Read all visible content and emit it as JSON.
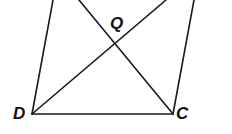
{
  "diagram": {
    "type": "geometry-quadrilateral-with-diagonals",
    "labels": {
      "D": "D",
      "C": "C",
      "Q": "Q"
    },
    "points": {
      "D": [
        32,
        114
      ],
      "C": [
        173,
        114
      ],
      "Q": [
        115,
        43
      ],
      "left_side_top": [
        53,
        0
      ],
      "right_side_top": [
        194,
        0
      ],
      "diagonal_from_C_top": [
        79,
        0
      ],
      "diagonal_from_D_top": [
        166,
        0
      ]
    },
    "segments": [
      {
        "name": "side-DC",
        "from": "D",
        "to": "C"
      },
      {
        "name": "side-left",
        "from": "D",
        "to": "left_side_top"
      },
      {
        "name": "side-right",
        "from": "C",
        "to": "right_side_top"
      },
      {
        "name": "diagonal-from-D",
        "from": "D",
        "to": "diagonal_from_D_top"
      },
      {
        "name": "diagonal-from-C",
        "from": "C",
        "to": "diagonal_from_C_top"
      }
    ],
    "line_color": "#1a1a1a",
    "background": "#ffffff"
  }
}
